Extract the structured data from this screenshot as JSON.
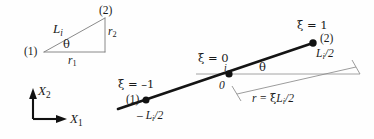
{
  "figure": {
    "name": "beam-element-geometry-diagram",
    "background_color": "#fefefe",
    "ink_color": "#1a1a1a",
    "thin_line_color": "#8c8c8c",
    "width": 374,
    "height": 139
  },
  "triangle_diagram": {
    "name": "projection-triangle",
    "node1_label": "(1)",
    "node2_label": "(2)",
    "hypotenuse_label_base": "L",
    "hypotenuse_label_sub": "i",
    "vertical_leg_label_base": "r",
    "vertical_leg_label_sub": "2",
    "horizontal_leg_label_base": "r",
    "horizontal_leg_label_sub": "1",
    "angle_label": "θ",
    "vertices": {
      "node1": [
        44,
        52
      ],
      "node2": [
        105,
        18
      ],
      "corner": [
        105,
        52
      ]
    }
  },
  "axes": {
    "name": "global-coordinate-axes",
    "x1_label_base": "X",
    "x1_label_sub": "1",
    "x2_label_base": "X",
    "x2_label_sub": "2",
    "origin": [
      33,
      119
    ]
  },
  "beam_diagram": {
    "name": "natural-coordinate-beam",
    "node1_label": "(1)",
    "node2_label": "(2)",
    "center_node_label": "i",
    "origin_label": "0",
    "xi_start": "ξ = –1",
    "xi_center": "ξ = 0",
    "xi_end": "ξ = 1",
    "length_left_label": "– L",
    "length_left_sub": "i",
    "length_left_tail": "/2",
    "length_right_label": "L",
    "length_right_sub": "i",
    "length_right_tail": "/2",
    "angle_label": "θ",
    "radius_label_lead": "r = ",
    "radius_label_xi": "ξ",
    "radius_label_base": "L",
    "radius_label_sub": "i",
    "radius_label_tail": "/2",
    "node1_point": [
      146,
      100
    ],
    "center_point": [
      229,
      74
    ],
    "node2_point": [
      313,
      43
    ]
  }
}
